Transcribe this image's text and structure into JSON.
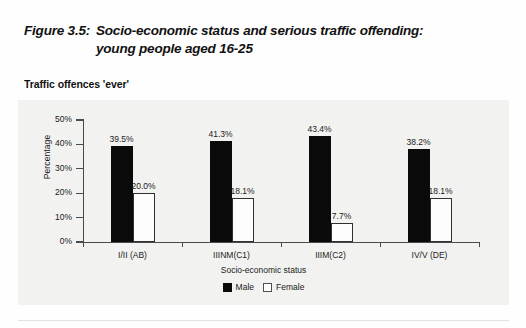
{
  "figure": {
    "number": "Figure 3.5:",
    "title_line1": "Socio-economic status and serious traffic offending:",
    "title_line2": "young people aged 16-25",
    "subtitle": "Traffic offences 'ever'"
  },
  "legend": {
    "male_label": "Male",
    "female_label": "Female"
  },
  "chart_data": {
    "type": "bar",
    "title": "Socio-economic status and serious traffic offending: young people aged 16-25",
    "subtitle": "Traffic offences 'ever'",
    "xlabel": "Socio-economic status",
    "ylabel": "Percentage",
    "categories": [
      "I/II (AB)",
      "IIINM(C1)",
      "IIIM(C2)",
      "IV/V (DE)"
    ],
    "series": [
      {
        "name": "Male",
        "color": "#0a0a0a",
        "values": [
          39.5,
          41.3,
          43.4,
          38.2
        ],
        "labels": [
          "39.5%",
          "41.3%",
          "43.4%",
          "38.2%"
        ]
      },
      {
        "name": "Female",
        "color": "#ffffff",
        "values": [
          20.0,
          18.1,
          7.7,
          18.1
        ],
        "labels": [
          "20.0%",
          "18.1%",
          "7.7%",
          "18.1%"
        ]
      }
    ],
    "ylim": [
      0,
      50
    ],
    "yticks": [
      0,
      10,
      20,
      30,
      40,
      50
    ],
    "ytick_labels": [
      "0%",
      "10%",
      "20%",
      "30%",
      "40%",
      "50%"
    ],
    "grid": false,
    "legend_position": "bottom-center"
  }
}
